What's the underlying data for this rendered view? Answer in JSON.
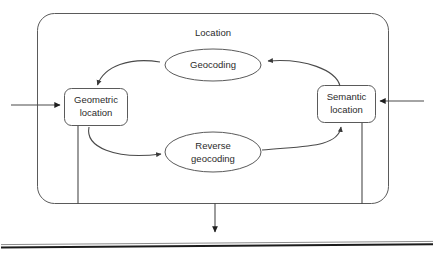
{
  "diagram": {
    "type": "flow-diagram",
    "title": "Location",
    "container": {
      "name": "Location",
      "shape": "rounded-rectangle",
      "label": "Location"
    },
    "nodes": [
      {
        "id": "geometric-location",
        "label": "Geometric location",
        "label_line1": "Geometric",
        "label_line2": "location",
        "shape": "rounded-rectangle"
      },
      {
        "id": "semantic-location",
        "label": "Semantic location",
        "label_line1": "Semantic",
        "label_line2": "location",
        "shape": "rounded-rectangle"
      },
      {
        "id": "geocoding",
        "label": "Geocoding",
        "label_line1": "Geocoding",
        "label_line2": "",
        "shape": "ellipse"
      },
      {
        "id": "reverse-geocoding",
        "label": "Reverse geocoding",
        "label_line1": "Reverse",
        "label_line2": "geocoding",
        "shape": "ellipse"
      }
    ],
    "edges": [
      {
        "from": "semantic-location",
        "to": "geocoding",
        "label": ""
      },
      {
        "from": "geocoding",
        "to": "geometric-location",
        "label": ""
      },
      {
        "from": "geometric-location",
        "to": "reverse-geocoding",
        "label": ""
      },
      {
        "from": "reverse-geocoding",
        "to": "semantic-location",
        "label": ""
      }
    ],
    "external_connectors": [
      {
        "id": "input-left",
        "direction": "right",
        "target": "geometric-location",
        "label": ""
      },
      {
        "id": "input-right",
        "direction": "left",
        "target": "semantic-location",
        "label": ""
      },
      {
        "id": "output-bottom",
        "direction": "down",
        "source": "location-container",
        "label": ""
      }
    ],
    "colors": {
      "stroke": "#5a5a5a",
      "edge": "#4a4a4a",
      "text": "#2b2b2b",
      "background": "#ffffff",
      "rule": "#1c1c1c"
    }
  }
}
